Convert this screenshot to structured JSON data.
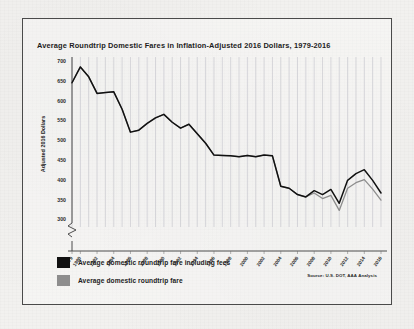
{
  "figure": {
    "title": "Average Roundtrip Domestic Fares in Inflation-Adjusted 2016 Dollars, 1979-2016",
    "source_note": "Source: U.S. DOT, AAA Analysis",
    "frame_color": "#4a4a4a",
    "background_color": "#f2f1ef"
  },
  "legend": {
    "position": "below-plot-left",
    "entries": [
      {
        "label": "Average domestic roundtrip fare including fees",
        "color": "#111111",
        "swatch": "black"
      },
      {
        "label": "Average domestic roundtrip fare",
        "color": "#8d8d8d",
        "swatch": "gray"
      }
    ]
  },
  "chart_data": {
    "type": "line",
    "title": "Average Roundtrip Domestic Fares in Inflation-Adjusted 2016 Dollars, 1979-2016",
    "xlabel": "",
    "ylabel": "Adjusted 2016 Dollars",
    "ylim": [
      280,
      700
    ],
    "yticks": [
      300,
      350,
      400,
      450,
      500,
      550,
      600,
      650,
      700
    ],
    "ytick_labels": [
      "300",
      "350",
      "400",
      "450",
      "500",
      "550",
      "600",
      "650",
      "700"
    ],
    "y_axis_break": true,
    "grid": "vertical-only",
    "legend_position": "below",
    "x": [
      1979,
      1980,
      1981,
      1982,
      1983,
      1984,
      1985,
      1986,
      1987,
      1988,
      1989,
      1990,
      1991,
      1992,
      1993,
      1994,
      1995,
      1996,
      1997,
      1998,
      1999,
      2000,
      2001,
      2002,
      2003,
      2004,
      2005,
      2006,
      2007,
      2008,
      2009,
      2010,
      2011,
      2012,
      2013,
      2014,
      2015,
      2016
    ],
    "xtick_labels": [
      "1979",
      "1980",
      "1982",
      "1984",
      "1986",
      "1988",
      "1990",
      "1992",
      "1994",
      "1996",
      "1998",
      "2000",
      "2002",
      "2004",
      "2006",
      "2008",
      "2010",
      "2012",
      "2014",
      "2016"
    ],
    "series": [
      {
        "name": "Average domestic roundtrip fare including fees",
        "color": "#111111",
        "values": [
          645,
          685,
          660,
          618,
          620,
          622,
          578,
          520,
          525,
          542,
          556,
          565,
          545,
          530,
          540,
          516,
          492,
          462,
          461,
          460,
          458,
          461,
          458,
          462,
          460,
          383,
          378,
          362,
          356,
          372,
          362,
          375,
          340,
          398,
          415,
          425,
          398,
          366
        ]
      },
      {
        "name": "Average domestic roundtrip fare",
        "color": "#8d8d8d",
        "values": [
          645,
          685,
          660,
          618,
          620,
          622,
          578,
          520,
          525,
          542,
          556,
          565,
          545,
          530,
          540,
          516,
          492,
          462,
          461,
          460,
          458,
          461,
          458,
          462,
          460,
          383,
          378,
          362,
          356,
          366,
          352,
          360,
          322,
          378,
          392,
          400,
          376,
          348
        ]
      }
    ],
    "annotations": {
      "peak_year": 1980,
      "peak_value": 685,
      "final_year": 2016,
      "final_value_including_fees": 366,
      "final_value_base_fare": 348
    }
  }
}
